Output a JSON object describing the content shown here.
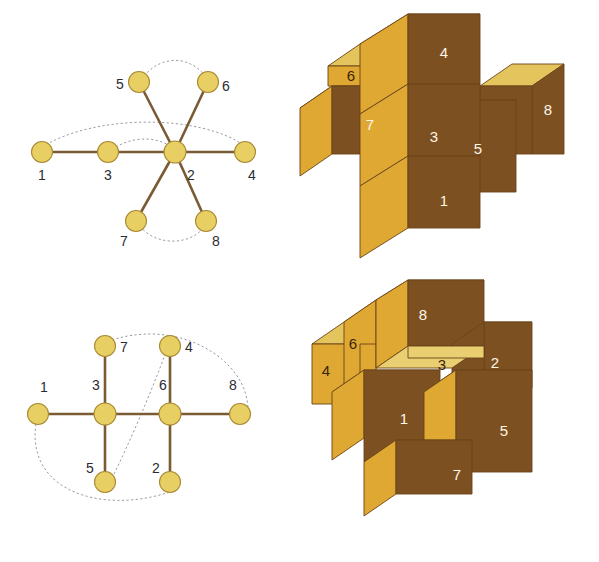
{
  "figure": {
    "caption": "",
    "background_color": "#ffffff"
  },
  "palette": {
    "node_fill": "#e8cf63",
    "node_fill_light": "#edd77a",
    "node_stroke": "#a98a33",
    "edge_color": "#7a5b33",
    "dashed_edge_color": "#9a9aa8",
    "label_color": "#2b2b33",
    "cube_top": "#e4c45c",
    "cube_top_light": "#e9cf72",
    "cube_side": "#dfa832",
    "cube_front": "#7d5022",
    "cube_edge": "#6b4418",
    "cube_number_light": "#fdf6e4",
    "cube_number_dark": "#3a2408"
  },
  "graphs": [
    {
      "id": "graph-top",
      "name": "star-graph",
      "nodes": [
        {
          "label": "1",
          "x": 42,
          "y": 118,
          "lx": 42,
          "ly": 146
        },
        {
          "label": "3",
          "x": 108,
          "y": 118,
          "lx": 108,
          "ly": 146
        },
        {
          "label": "2",
          "x": 175,
          "y": 118,
          "lx": 191,
          "ly": 146
        },
        {
          "label": "4",
          "x": 245,
          "y": 118,
          "lx": 252,
          "ly": 146
        },
        {
          "label": "5",
          "x": 139,
          "y": 48,
          "lx": 120,
          "ly": 55
        },
        {
          "label": "6",
          "x": 208,
          "y": 48,
          "lx": 226,
          "ly": 57
        },
        {
          "label": "7",
          "x": 136,
          "y": 187,
          "lx": 124,
          "ly": 212
        },
        {
          "label": "8",
          "x": 206,
          "y": 187,
          "lx": 216,
          "ly": 212
        }
      ],
      "solid_edges": [
        [
          "1",
          "3"
        ],
        [
          "3",
          "2"
        ],
        [
          "2",
          "4"
        ],
        [
          "2",
          "5"
        ],
        [
          "2",
          "6"
        ],
        [
          "2",
          "7"
        ],
        [
          "2",
          "8"
        ]
      ],
      "dashed_arcs": [
        {
          "from": "1",
          "to": "4",
          "bow": 30
        },
        {
          "from": "5",
          "to": "6",
          "bow": 26
        },
        {
          "from": "7",
          "to": "8",
          "bow": -22
        }
      ]
    },
    {
      "id": "graph-bottom",
      "name": "ladder-graph",
      "nodes": [
        {
          "label": "1",
          "x": 38,
          "y": 104,
          "lx": 44,
          "ly": 82
        },
        {
          "label": "3",
          "x": 105,
          "y": 104,
          "lx": 96,
          "ly": 80
        },
        {
          "label": "6",
          "x": 170,
          "y": 104,
          "lx": 163,
          "ly": 80
        },
        {
          "label": "8",
          "x": 240,
          "y": 104,
          "lx": 233,
          "ly": 80
        },
        {
          "label": "7",
          "x": 105,
          "y": 36,
          "lx": 124,
          "ly": 42
        },
        {
          "label": "4",
          "x": 170,
          "y": 36,
          "lx": 189,
          "ly": 42
        },
        {
          "label": "5",
          "x": 105,
          "y": 172,
          "lx": 90,
          "ly": 163
        },
        {
          "label": "2",
          "x": 170,
          "y": 172,
          "lx": 156,
          "ly": 163
        }
      ],
      "solid_edges": [
        [
          "1",
          "3"
        ],
        [
          "3",
          "6"
        ],
        [
          "6",
          "8"
        ],
        [
          "3",
          "7"
        ],
        [
          "3",
          "5"
        ],
        [
          "6",
          "4"
        ],
        [
          "6",
          "2"
        ]
      ],
      "dashed_arcs": [
        {
          "from": "1",
          "to": "2",
          "bow": -46
        },
        {
          "from": "5",
          "to": "4",
          "bow": 0
        },
        {
          "from": "7",
          "to": "8",
          "bow": 34
        }
      ]
    }
  ],
  "cube_figures": [
    {
      "id": "cubes-top",
      "name": "cube-assembly-upper",
      "faces": [
        {
          "label": "6",
          "tone": "dark"
        },
        {
          "label": "4",
          "tone": "light"
        },
        {
          "label": "8",
          "tone": "light"
        },
        {
          "label": "7",
          "tone": "light"
        },
        {
          "label": "5",
          "tone": "light"
        },
        {
          "label": "3",
          "tone": "light"
        },
        {
          "label": "1",
          "tone": "light"
        }
      ]
    },
    {
      "id": "cubes-bottom",
      "name": "cube-assembly-lower",
      "faces": [
        {
          "label": "4",
          "tone": "dark"
        },
        {
          "label": "8",
          "tone": "light"
        },
        {
          "label": "6",
          "tone": "dark"
        },
        {
          "label": "3",
          "tone": "dark"
        },
        {
          "label": "2",
          "tone": "light"
        },
        {
          "label": "1",
          "tone": "light"
        },
        {
          "label": "5",
          "tone": "light"
        },
        {
          "label": "7",
          "tone": "light"
        }
      ]
    }
  ]
}
